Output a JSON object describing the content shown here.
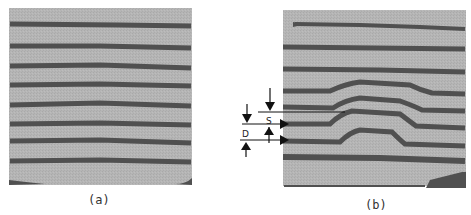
{
  "figure": {
    "panels": [
      {
        "id": "a",
        "caption": "(a)"
      },
      {
        "id": "b",
        "caption": "(b)"
      }
    ],
    "annotations": {
      "s_label": "S",
      "d_label": "D"
    },
    "colors": {
      "background_gray": "#b3b3b3",
      "layer_dark": "#505050",
      "page": "#ffffff",
      "ink": "#111111"
    }
  }
}
